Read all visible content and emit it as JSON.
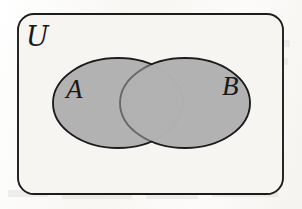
{
  "figure": {
    "type": "venn-diagram",
    "universal_set_label": "ℳ",
    "universal_set_label_text": "U",
    "set_a_label": "A",
    "set_b_label": "B",
    "region_shading": "all",
    "colors": {
      "paper": "#fbfbf9",
      "universe_fill": "#f6f5f2",
      "set_fill": "#b2b2b2",
      "stroke": "#1c1c1c"
    },
    "geometry": {
      "universe": {
        "x": 18,
        "y": 14,
        "width": 265,
        "height": 180,
        "corner_radius": 16
      },
      "set_a": {
        "cx": 118,
        "cy": 103,
        "rx": 65,
        "ry": 45
      },
      "set_b": {
        "cx": 185,
        "cy": 103,
        "rx": 65,
        "ry": 45
      }
    },
    "label_positions": {
      "universal": {
        "x": 26,
        "y": 46
      },
      "a": {
        "x": 66,
        "y": 98
      },
      "b": {
        "x": 222,
        "y": 95
      }
    }
  },
  "bleed_through_marks": [
    {
      "left": 170,
      "top": 40,
      "width": 46
    },
    {
      "left": 228,
      "top": 40,
      "width": 62
    },
    {
      "left": 86,
      "top": 56,
      "width": 40
    },
    {
      "left": 136,
      "top": 56,
      "width": 54
    },
    {
      "left": 206,
      "top": 56,
      "width": 30
    },
    {
      "left": 254,
      "top": 58,
      "width": 34
    },
    {
      "left": 240,
      "top": 128,
      "width": 44
    },
    {
      "left": 60,
      "top": 168,
      "width": 36
    },
    {
      "left": 108,
      "top": 166,
      "width": 58
    },
    {
      "left": 182,
      "top": 166,
      "width": 44
    },
    {
      "left": 8,
      "top": 190,
      "width": 40
    },
    {
      "left": 62,
      "top": 192,
      "width": 70
    },
    {
      "left": 146,
      "top": 192,
      "width": 52
    },
    {
      "left": 212,
      "top": 190,
      "width": 66
    }
  ]
}
